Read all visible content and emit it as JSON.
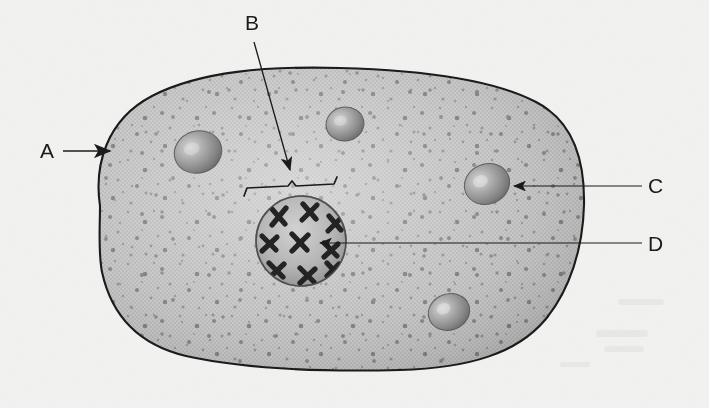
{
  "figure": {
    "kind": "biology-cell-diagram",
    "background_color": "#f3f3f1",
    "ink_color": "#1b1b1b",
    "cytoplasm_color": "#b9b9b9",
    "nucleus_color": "#a6a6a6",
    "organelle_color": "#9a9a9a"
  },
  "labels": [
    {
      "id": "A",
      "text": "A",
      "x": 48,
      "y": 158,
      "leader": "arrow-right",
      "target": "cell-membrane"
    },
    {
      "id": "B",
      "text": "B",
      "x": 251,
      "y": 30,
      "leader": "diagonal-arrow-down-right",
      "target": "nuclear-region-bracket"
    },
    {
      "id": "C",
      "text": "C",
      "x": 653,
      "y": 193,
      "leader": "arrow-left",
      "target": "mitochondrion"
    },
    {
      "id": "D",
      "text": "D",
      "x": 653,
      "y": 251,
      "leader": "line-left",
      "target": "chromosome"
    }
  ],
  "structures": {
    "cell_membrane": {
      "name": "cell membrane",
      "label": "A"
    },
    "nuclear_region": {
      "name": "nuclear region",
      "label": "B"
    },
    "mitochondrion": {
      "name": "mitochondrion",
      "label": "C"
    },
    "chromosome": {
      "name": "chromosome",
      "label": "D"
    },
    "nucleus": {
      "name": "nucleus",
      "cx": 301,
      "cy": 241,
      "r": 46
    },
    "chromosome_count": 9,
    "organelle_count": 5
  },
  "organelles": [
    {
      "cx": 198,
      "cy": 152,
      "rx": 24,
      "ry": 21,
      "rot": -18
    },
    {
      "cx": 345,
      "cy": 124,
      "rx": 19,
      "ry": 17,
      "rot": -10
    },
    {
      "cx": 487,
      "cy": 184,
      "rx": 23,
      "ry": 20,
      "rot": -22
    },
    {
      "cx": 449,
      "cy": 312,
      "rx": 21,
      "ry": 18,
      "rot": -20
    }
  ]
}
